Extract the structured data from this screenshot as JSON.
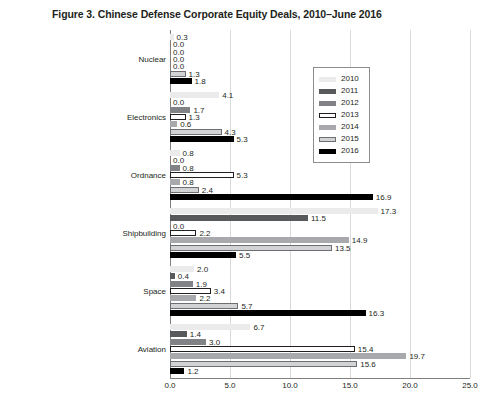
{
  "chart_data": {
    "type": "bar",
    "orientation": "horizontal",
    "title": "Figure 3. Chinese Defense Corporate Equity Deals, 2010–June 2016",
    "xlabel": "",
    "ylabel": "",
    "xlim": [
      0,
      25
    ],
    "xticks": [
      "0.0",
      "5.0",
      "10.0",
      "15.0",
      "20.0",
      "25.0"
    ],
    "xtick_values": [
      0,
      5,
      10,
      15,
      20,
      25
    ],
    "grid": true,
    "legend_position": "upper right",
    "categories": [
      "Nuclear",
      "Electronics",
      "Ordnance",
      "Shipbuilding",
      "Space",
      "Aviation"
    ],
    "series": [
      {
        "name": "2010",
        "color": "#ebebeb",
        "border": "#ebebeb",
        "values": [
          0.3,
          4.1,
          0.8,
          17.3,
          2.0,
          6.7
        ],
        "labels": [
          "0.3",
          "4.1",
          "0.8",
          "17.3",
          "2.0",
          "6.7"
        ]
      },
      {
        "name": "2011",
        "color": "#58595b",
        "border": "#58595b",
        "values": [
          0.0,
          0.0,
          0.0,
          11.5,
          0.4,
          1.4
        ],
        "labels": [
          "0.0",
          "0.0",
          "0.0",
          "11.5",
          "0.4",
          "1.4"
        ]
      },
      {
        "name": "2012",
        "color": "#808285",
        "border": "#808285",
        "values": [
          0.0,
          1.7,
          0.8,
          0.0,
          1.9,
          3.0
        ],
        "labels": [
          "0.0",
          "1.7",
          "0.8",
          "0.0",
          "1.9",
          "3.0"
        ]
      },
      {
        "name": "2013",
        "color": "#ffffff",
        "border": "#231f20",
        "values": [
          0.0,
          1.3,
          5.3,
          2.2,
          3.4,
          15.4
        ],
        "labels": [
          "0.0",
          "1.3",
          "5.3",
          "2.2",
          "3.4",
          "15.4"
        ]
      },
      {
        "name": "2014",
        "color": "#a7a9ac",
        "border": "#a7a9ac",
        "values": [
          0.0,
          0.6,
          0.8,
          14.9,
          2.2,
          19.7
        ],
        "labels": [
          "0.0",
          "0.6",
          "0.8",
          "14.9",
          "2.2",
          "19.7"
        ]
      },
      {
        "name": "2015",
        "color": "#d1d3d4",
        "border": "#6d6e71",
        "values": [
          1.3,
          4.3,
          2.4,
          13.5,
          5.7,
          15.6
        ],
        "labels": [
          "1.3",
          "4.3",
          "2.4",
          "13.5",
          "5.7",
          "15.6"
        ]
      },
      {
        "name": "2016",
        "color": "#000000",
        "border": "#000000",
        "values": [
          1.8,
          5.3,
          16.9,
          5.5,
          16.3,
          1.2
        ],
        "labels": [
          "1.8",
          "5.3",
          "16.9",
          "5.5",
          "16.3",
          "1.2"
        ]
      }
    ]
  }
}
